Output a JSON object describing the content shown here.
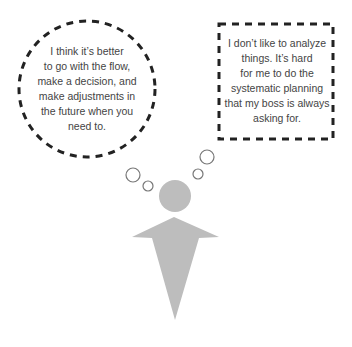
{
  "colors": {
    "outline": "#222222",
    "figure": "#bdbdbd",
    "text": "#444444",
    "small_bubble_stroke": "#777777",
    "background": "#ffffff"
  },
  "left_thought": {
    "shape": "dashed-circle",
    "lines": [
      "I think it’s better",
      "to go with the flow,",
      "make a decision, and",
      "make adjustments in",
      "the future when you",
      "need to."
    ]
  },
  "right_thought": {
    "shape": "dashed-rectangle",
    "lines": [
      "I don’t like to analyze",
      "things. It’s hard",
      "for me to do the",
      "systematic planning",
      "that my boss is always",
      "asking for."
    ]
  },
  "figure": {
    "icon": "person-icon"
  }
}
